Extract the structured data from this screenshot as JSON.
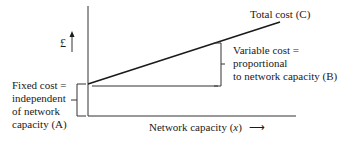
{
  "diagram": {
    "y_axis_symbol": "£",
    "x_axis_label": "Network capacity (",
    "x_axis_var": "x",
    "x_axis_label_end": ")",
    "x_axis_arrow": "⟶",
    "total_cost_label": "Total cost (C)",
    "variable_cost_lines": [
      "Variable cost =",
      "proportional",
      "to network capacity (B)"
    ],
    "fixed_cost_lines": [
      "Fixed cost =",
      "independent",
      "of network",
      "capacity (A)"
    ]
  },
  "colors": {
    "line": "#1a1a1a",
    "thin_line": "#333333",
    "background": "#ffffff"
  }
}
